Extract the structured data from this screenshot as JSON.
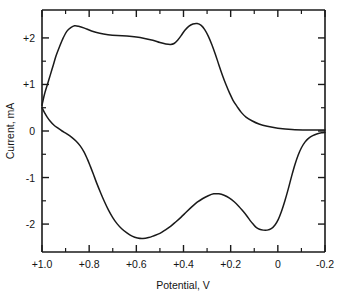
{
  "chart_data": {
    "type": "line",
    "title": "",
    "subtitle": "",
    "xlabel": "Potential, V",
    "ylabel": "Current, mA",
    "xlim": [
      1.0,
      -0.2
    ],
    "ylim": [
      -2.6,
      2.6
    ],
    "grid": false,
    "legend": "none",
    "x_ticks_major": [
      "+1.0",
      "+0.8",
      "+0.6",
      "+0.4",
      "+0.2",
      "0",
      "-0.2"
    ],
    "x_tick_values": [
      1.0,
      0.8,
      0.6,
      0.4,
      0.2,
      0.0,
      -0.2
    ],
    "x_minor_tick_values": [
      0.9,
      0.7,
      0.5,
      0.3,
      0.1,
      -0.1
    ],
    "y_ticks_major": [
      "+2",
      "+1",
      "0",
      "-1",
      "-2"
    ],
    "y_tick_values": [
      2,
      1,
      0,
      -1,
      -2
    ],
    "y_minor_tick_values": [
      1.5,
      0.5,
      -0.5,
      -1.5
    ],
    "series": [
      {
        "name": "anodic-forward-scan",
        "points": [
          [
            1.0,
            0.55
          ],
          [
            0.99,
            0.78
          ],
          [
            0.977,
            1.0
          ],
          [
            0.965,
            1.2
          ],
          [
            0.952,
            1.42
          ],
          [
            0.94,
            1.62
          ],
          [
            0.925,
            1.82
          ],
          [
            0.91,
            2.0
          ],
          [
            0.895,
            2.14
          ],
          [
            0.878,
            2.22
          ],
          [
            0.862,
            2.26
          ],
          [
            0.845,
            2.25
          ],
          [
            0.82,
            2.21
          ],
          [
            0.79,
            2.15
          ],
          [
            0.755,
            2.1
          ],
          [
            0.72,
            2.07
          ],
          [
            0.68,
            2.05
          ],
          [
            0.64,
            2.04
          ],
          [
            0.6,
            2.02
          ],
          [
            0.565,
            1.99
          ],
          [
            0.53,
            1.95
          ],
          [
            0.5,
            1.9
          ],
          [
            0.475,
            1.87
          ],
          [
            0.455,
            1.86
          ],
          [
            0.44,
            1.88
          ],
          [
            0.425,
            1.95
          ],
          [
            0.41,
            2.05
          ],
          [
            0.395,
            2.16
          ],
          [
            0.378,
            2.25
          ],
          [
            0.36,
            2.3
          ],
          [
            0.342,
            2.31
          ],
          [
            0.325,
            2.27
          ],
          [
            0.31,
            2.18
          ],
          [
            0.295,
            2.04
          ],
          [
            0.28,
            1.86
          ],
          [
            0.265,
            1.65
          ],
          [
            0.25,
            1.42
          ],
          [
            0.235,
            1.2
          ],
          [
            0.22,
            1.0
          ],
          [
            0.205,
            0.82
          ],
          [
            0.19,
            0.66
          ],
          [
            0.172,
            0.52
          ],
          [
            0.155,
            0.4
          ],
          [
            0.135,
            0.3
          ],
          [
            0.11,
            0.22
          ],
          [
            0.08,
            0.15
          ],
          [
            0.045,
            0.1
          ],
          [
            0.0,
            0.06
          ],
          [
            -0.06,
            0.03
          ],
          [
            -0.13,
            0.02
          ],
          [
            -0.2,
            0.02
          ]
        ]
      },
      {
        "name": "cathodic-reverse-scan",
        "points": [
          [
            1.0,
            0.5
          ],
          [
            0.99,
            0.4
          ],
          [
            0.978,
            0.3
          ],
          [
            0.965,
            0.21
          ],
          [
            0.95,
            0.13
          ],
          [
            0.932,
            0.06
          ],
          [
            0.915,
            0.0
          ],
          [
            0.895,
            -0.06
          ],
          [
            0.875,
            -0.13
          ],
          [
            0.855,
            -0.22
          ],
          [
            0.838,
            -0.32
          ],
          [
            0.822,
            -0.45
          ],
          [
            0.808,
            -0.6
          ],
          [
            0.795,
            -0.76
          ],
          [
            0.782,
            -0.93
          ],
          [
            0.768,
            -1.12
          ],
          [
            0.752,
            -1.32
          ],
          [
            0.735,
            -1.52
          ],
          [
            0.718,
            -1.7
          ],
          [
            0.7,
            -1.86
          ],
          [
            0.682,
            -1.99
          ],
          [
            0.662,
            -2.1
          ],
          [
            0.64,
            -2.19
          ],
          [
            0.618,
            -2.26
          ],
          [
            0.595,
            -2.3
          ],
          [
            0.572,
            -2.31
          ],
          [
            0.548,
            -2.29
          ],
          [
            0.525,
            -2.25
          ],
          [
            0.5,
            -2.2
          ],
          [
            0.478,
            -2.13
          ],
          [
            0.455,
            -2.05
          ],
          [
            0.432,
            -1.95
          ],
          [
            0.41,
            -1.85
          ],
          [
            0.388,
            -1.74
          ],
          [
            0.365,
            -1.63
          ],
          [
            0.342,
            -1.53
          ],
          [
            0.318,
            -1.45
          ],
          [
            0.295,
            -1.39
          ],
          [
            0.272,
            -1.35
          ],
          [
            0.25,
            -1.35
          ],
          [
            0.228,
            -1.38
          ],
          [
            0.205,
            -1.44
          ],
          [
            0.185,
            -1.52
          ],
          [
            0.165,
            -1.62
          ],
          [
            0.148,
            -1.72
          ],
          [
            0.132,
            -1.82
          ],
          [
            0.118,
            -1.92
          ],
          [
            0.105,
            -2.0
          ],
          [
            0.092,
            -2.07
          ],
          [
            0.078,
            -2.11
          ],
          [
            0.062,
            -2.13
          ],
          [
            0.045,
            -2.13
          ],
          [
            0.028,
            -2.1
          ],
          [
            0.012,
            -2.02
          ],
          [
            -0.002,
            -1.9
          ],
          [
            -0.016,
            -1.72
          ],
          [
            -0.03,
            -1.5
          ],
          [
            -0.044,
            -1.25
          ],
          [
            -0.058,
            -0.98
          ],
          [
            -0.072,
            -0.73
          ],
          [
            -0.086,
            -0.52
          ],
          [
            -0.1,
            -0.36
          ],
          [
            -0.115,
            -0.24
          ],
          [
            -0.13,
            -0.16
          ],
          [
            -0.148,
            -0.1
          ],
          [
            -0.168,
            -0.06
          ],
          [
            -0.185,
            -0.04
          ],
          [
            -0.2,
            -0.03
          ]
        ]
      }
    ],
    "annotations": []
  },
  "axes": {
    "x_title": "Potential, V",
    "y_title": "Current, mA"
  }
}
